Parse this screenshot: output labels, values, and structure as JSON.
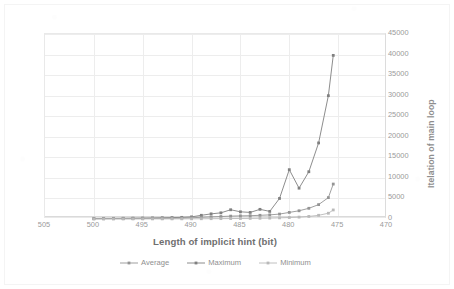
{
  "chart_data": {
    "type": "line",
    "title": "",
    "xlabel": "Length of implicit hint (bit)",
    "ylabel": "Itelation of main loop",
    "xlim": [
      505,
      470
    ],
    "ylim": [
      0,
      45000
    ],
    "x_reversed": true,
    "grid": true,
    "legend_position": "bottom",
    "xticks": [
      505,
      500,
      495,
      490,
      485,
      480,
      475,
      470
    ],
    "yticks": [
      0,
      5000,
      10000,
      15000,
      20000,
      25000,
      30000,
      35000,
      40000,
      45000
    ],
    "x": [
      500,
      499,
      498,
      497,
      496,
      495,
      494,
      493,
      492,
      491,
      490,
      489,
      488,
      487,
      486,
      485,
      484,
      483,
      482,
      481,
      480,
      479,
      478,
      477,
      476,
      475.5
    ],
    "series": [
      {
        "name": "Maximum",
        "color": "#808080",
        "values": [
          120,
          140,
          150,
          170,
          200,
          230,
          260,
          300,
          340,
          400,
          520,
          900,
          1250,
          1500,
          2250,
          1750,
          1600,
          2350,
          1850,
          5000,
          12000,
          7500,
          11500,
          18500,
          30000,
          39800
        ]
      },
      {
        "name": "Average",
        "color": "#949494",
        "values": [
          60,
          70,
          80,
          90,
          100,
          120,
          140,
          160,
          185,
          220,
          300,
          420,
          520,
          600,
          700,
          760,
          800,
          900,
          1000,
          1200,
          1600,
          2000,
          2600,
          3500,
          5200,
          8500
        ]
      },
      {
        "name": "Minimum",
        "color": "#b9b9b9",
        "values": [
          10,
          12,
          14,
          16,
          18,
          20,
          24,
          28,
          32,
          38,
          45,
          60,
          75,
          90,
          110,
          130,
          150,
          180,
          220,
          280,
          360,
          460,
          620,
          900,
          1400,
          2200
        ]
      }
    ]
  },
  "legend": {
    "items": [
      {
        "label": "Average",
        "color": "#949494"
      },
      {
        "label": "Maximum",
        "color": "#808080"
      },
      {
        "label": "Minimum",
        "color": "#b9b9b9"
      }
    ]
  },
  "axes": {
    "x_title": "Length of implicit hint (bit)",
    "y_title": "Itelation of main loop"
  },
  "colors": {
    "grid": "#ededed",
    "axis_text": "#9a9a9a",
    "title_text": "#6f6f6f",
    "plot_border": "#e9e9e9",
    "background": "#ffffff"
  }
}
